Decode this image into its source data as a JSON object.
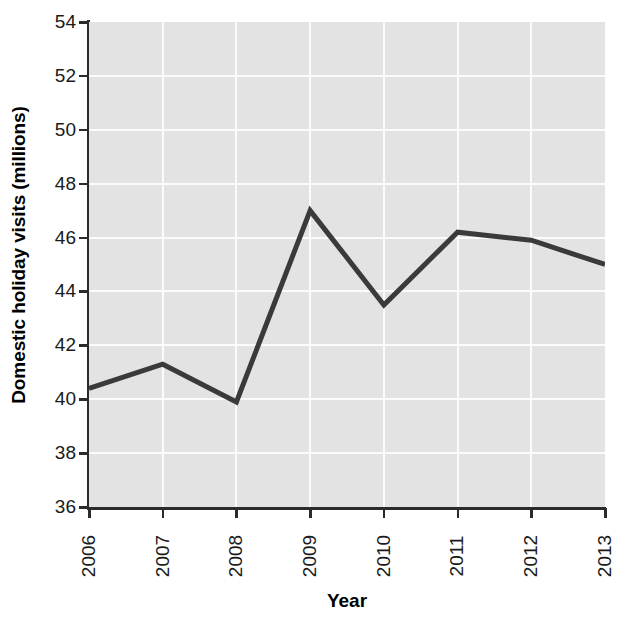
{
  "chart_data": {
    "type": "line",
    "title": "",
    "xlabel": "Year",
    "ylabel": "Domestic holiday visits (millions)",
    "categories": [
      "2006",
      "2007",
      "2008",
      "2009",
      "2010",
      "2011",
      "2012",
      "2013"
    ],
    "values": [
      40.4,
      41.3,
      39.9,
      47.0,
      43.5,
      46.2,
      45.9,
      45.0
    ],
    "series": [
      {
        "name": "Domestic holiday visits",
        "values": [
          40.4,
          41.3,
          39.9,
          47.0,
          43.5,
          46.2,
          45.9,
          45.0
        ]
      }
    ],
    "ylim": [
      36,
      54
    ],
    "xlim": [
      "2006",
      "2013"
    ],
    "y_ticks": [
      36,
      38,
      40,
      42,
      44,
      46,
      48,
      50,
      52,
      54
    ],
    "y_tick_labels": [
      "36",
      "38",
      "40",
      "42",
      "44",
      "46",
      "48",
      "50",
      "52",
      "54"
    ],
    "x_ticks": [
      "2006",
      "2007",
      "2008",
      "2009",
      "2010",
      "2011",
      "2012",
      "2013"
    ],
    "grid": true,
    "legend": "none",
    "x_tick_label_rotation": 90,
    "colors": {
      "line": "#3a3a3a",
      "panel_background": "#e3e3e3",
      "gridline": "#fbfbfb",
      "axis": "#2b2b2b",
      "figure_background": "#ffffff",
      "text": "#1a1a1a"
    },
    "line_width_px": 5
  }
}
